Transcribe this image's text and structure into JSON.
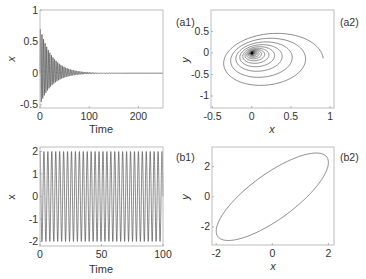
{
  "chart_data": [
    {
      "id": "a1",
      "type": "line",
      "panel_label": "(a1)",
      "title": "",
      "xlabel": "Time",
      "ylabel": "x",
      "xlim": [
        0,
        250
      ],
      "ylim": [
        -0.55,
        1
      ],
      "xticks": [
        0,
        100,
        200
      ],
      "xtick_labels": [
        "0",
        "100",
        "200"
      ],
      "yticks": [
        -0.5,
        0,
        0.5,
        1
      ],
      "ytick_labels": [
        "-0.5",
        "0",
        "0.5",
        "1"
      ],
      "grid": false,
      "description": "Damped oscillation of x(t); envelope starts near +0.72 / -0.5 and decays to 0 by about t=100",
      "series": [
        {
          "name": "x(t)",
          "initial_amplitude_upper": 0.72,
          "initial_amplitude_lower": -0.5,
          "decay_time": 25,
          "period": 3.2
        }
      ]
    },
    {
      "id": "a2",
      "type": "line",
      "panel_label": "(a2)",
      "title": "",
      "xlabel": "x",
      "ylabel": "y",
      "xlim": [
        -0.52,
        1.05
      ],
      "ylim": [
        -1.28,
        1
      ],
      "xticks": [
        -0.5,
        0,
        0.5,
        1
      ],
      "xtick_labels": [
        "-0.5",
        "0",
        "0.5",
        "1"
      ],
      "yticks": [
        -1,
        -0.5,
        0,
        0.5,
        1
      ],
      "ytick_labels": [
        "-1",
        "-0.5",
        "0",
        "0.5"
      ],
      "grid": false,
      "description": "Phase portrait: tilted elliptical spiral starting near (1, 0) converging to the origin (0, 0)",
      "series": [
        {
          "name": "trajectory",
          "start": [
            1,
            0
          ],
          "end": [
            0,
            0
          ],
          "x_extent": [
            -0.45,
            1
          ],
          "y_extent": [
            -1.15,
            0.75
          ]
        }
      ]
    },
    {
      "id": "b1",
      "type": "line",
      "panel_label": "(b1)",
      "title": "",
      "xlabel": "Time",
      "ylabel": "x",
      "xlim": [
        0,
        100
      ],
      "ylim": [
        -2.2,
        2.2
      ],
      "xticks": [
        0,
        50,
        100
      ],
      "xtick_labels": [
        "0",
        "50",
        "100"
      ],
      "yticks": [
        -2,
        -1,
        0,
        1,
        2
      ],
      "ytick_labels": [
        "-2",
        "-1",
        "0",
        "1",
        "2"
      ],
      "grid": false,
      "description": "Sustained periodic oscillation of x(t) with amplitude about 2 and period about 3.2",
      "series": [
        {
          "name": "x(t)",
          "amplitude": 2.0,
          "period": 3.2
        }
      ]
    },
    {
      "id": "b2",
      "type": "line",
      "panel_label": "(b2)",
      "title": "",
      "xlabel": "x",
      "ylabel": "y",
      "xlim": [
        -2.15,
        2.2
      ],
      "ylim": [
        -3.2,
        3.3
      ],
      "xticks": [
        -2,
        0,
        2
      ],
      "xtick_labels": [
        "-2",
        "0",
        "2"
      ],
      "yticks": [
        -2,
        0,
        2
      ],
      "ytick_labels": [
        "-2",
        "0",
        "2"
      ],
      "grid": false,
      "description": "Limit cycle: closed tilted ellipse with x in [-2, 2] and y in [-2.9, 2.9]",
      "series": [
        {
          "name": "limit cycle",
          "x_extent": [
            -2,
            2
          ],
          "y_extent": [
            -2.9,
            2.9
          ]
        }
      ]
    }
  ],
  "panels": {
    "a1": {
      "label": "(a1)"
    },
    "a2": {
      "label": "(a2)"
    },
    "b1": {
      "label": "(b1)"
    },
    "b2": {
      "label": "(b2)"
    }
  },
  "axes_text": {
    "time": "Time",
    "x": "x",
    "y": "y"
  }
}
